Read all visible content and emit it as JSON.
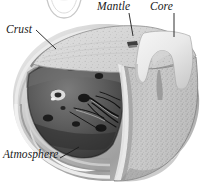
{
  "figure": {
    "kind": "cutaway-cross-section",
    "render": "grayscale halftone illustration",
    "background_color": "#ffffff",
    "ink_color": "#1a1a1a"
  },
  "labels": {
    "crust": "Crust",
    "mantle": "Mantle",
    "core": "Core",
    "atmosphere": "Atmosphere"
  },
  "layers": [
    {
      "name": "Atmosphere",
      "label": "Atmosphere",
      "appearance": "thin concentric light and dark bands wrapping the outer rim of the sphere",
      "color": "#d8d8d8"
    },
    {
      "name": "Crust",
      "label": "Crust",
      "appearance": "thin narrow band at the top cut edge of the sphere",
      "color": "#9a9a9a"
    },
    {
      "name": "Mantle",
      "label": "Mantle",
      "appearance": "thick speckled stippled wedge, light gray granular texture",
      "color": "#c2c2c2"
    },
    {
      "name": "Core",
      "label": "Core",
      "appearance": "smooth pale inverted tooth shape at the centre of the cut wedge",
      "color": "#ededed"
    },
    {
      "name": "Interior cavity",
      "label": "",
      "appearance": "dark gray concave hemisphere interior with dark blobs and thin branching filaments",
      "color": "#5a5a5a"
    }
  ],
  "leader_lines": [
    {
      "for": "Crust",
      "from": [
        36,
        30
      ],
      "to": [
        55,
        48
      ]
    },
    {
      "for": "Mantle",
      "from": [
        128,
        13
      ],
      "to": [
        133,
        35
      ]
    },
    {
      "for": "Core",
      "from": [
        174,
        13
      ],
      "to": [
        174,
        36
      ]
    },
    {
      "for": "Atmosphere",
      "from": [
        60,
        157
      ],
      "to": [
        77,
        148
      ]
    }
  ],
  "decorations": [
    {
      "name": "partial-arc-above",
      "description": "faint thin outlined arc clipped by the top edge of the frame, bottom of a circular element from the figure above",
      "center": [
        64,
        -6
      ],
      "radius": 18
    }
  ],
  "colors": {
    "paper": "#ffffff",
    "ink": "#1a1a1a",
    "mantle_light": "#d5d5d5",
    "mantle_mid": "#b6b6b6",
    "mantle_dark": "#8e8e8e",
    "core_light": "#f0f0f0",
    "core_shade": "#cfcfcf",
    "interior_dark": "#4e4e4e",
    "interior_darker": "#2b2b2b",
    "atmos_band": "#e2e2e2",
    "crust_band": "#8d8d8d"
  }
}
